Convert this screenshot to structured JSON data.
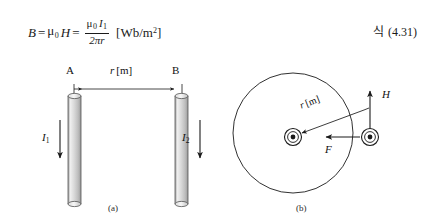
{
  "equation": {
    "lhs": "B",
    "eq1": "=",
    "mu0_H": "μ",
    "mu0_sub": "0",
    "H": "H",
    "eq2": "=",
    "numerator_mu": "μ",
    "numerator_mu_sub": "0",
    "numerator_I": "I",
    "numerator_I_sub": "1",
    "denominator": "2πr",
    "units_open": "[Wb/m",
    "units_exponent": "2",
    "units_close": "]",
    "full_text": "B = μ₀H = μ₀I₁ / 2πr [Wb/m²]"
  },
  "equation_label": {
    "prefix": "식",
    "number": "(4.31)"
  },
  "figure_a": {
    "caption": "(a)",
    "conductor_left_label": "A",
    "conductor_right_label": "B",
    "distance_label": "r",
    "distance_units": "[m]",
    "current_left": "I",
    "current_left_sub": "1",
    "current_right": "I",
    "current_right_sub": "2",
    "current_direction": "down",
    "rod_fill_light": "#f2f2f2",
    "rod_fill_mid": "#cfcfcf",
    "rod_outline": "#555555"
  },
  "figure_b": {
    "caption": "(b)",
    "field_circle_label": "",
    "radius_label": "r",
    "radius_units": "[m]",
    "field_vector_label": "H",
    "force_vector_label": "F",
    "conductor_marker": "current-out-of-page",
    "stroke_color": "#1a1a1a"
  }
}
